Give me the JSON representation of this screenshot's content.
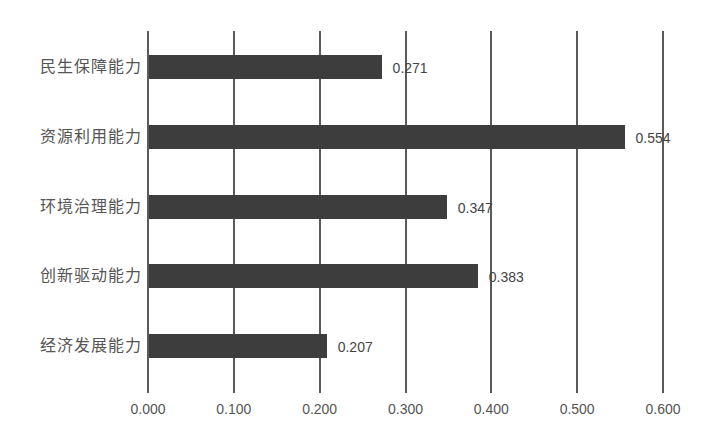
{
  "chart_data": {
    "type": "bar",
    "orientation": "horizontal",
    "title": "",
    "xlabel": "",
    "ylabel": "",
    "categories": [
      "民生保障能力",
      "资源利用能力",
      "环境治理能力",
      "创新驱动能力",
      "经济发展能力"
    ],
    "values": [
      0.271,
      0.554,
      0.347,
      0.383,
      0.207
    ],
    "value_labels": [
      "0.271",
      "0.554",
      "0.347",
      "0.383",
      "0.207"
    ],
    "xlim": [
      0,
      0.6
    ],
    "x_ticks": [
      "0.000",
      "0.100",
      "0.200",
      "0.300",
      "0.400",
      "0.500",
      "0.600"
    ],
    "grid": "vertical",
    "legend": "none",
    "bar_color": "#3d3d3d"
  }
}
